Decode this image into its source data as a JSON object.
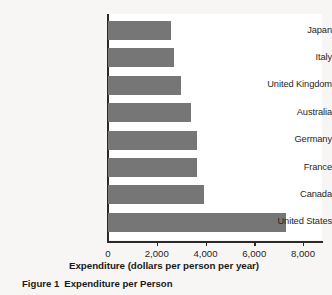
{
  "figure": {
    "caption_label": "Figure 1",
    "caption_title": "Expenditure per Person"
  },
  "colors": {
    "bar_fill": "#767676",
    "axis": "#2a2a2a",
    "plot_background": "#ffffff",
    "page_background": "#f7f6f4",
    "text": "#1f1f1f"
  },
  "chart_data": {
    "type": "bar",
    "orientation": "horizontal",
    "title": "",
    "subtitle": "",
    "xlabel": "Expenditure (dollars per person per year)",
    "ylabel": "",
    "categories": [
      "Japan",
      "Italy",
      "United Kingdom",
      "Australia",
      "Germany",
      "France",
      "Canada",
      "United States"
    ],
    "values": [
      2600,
      2700,
      3000,
      3400,
      3650,
      3650,
      3950,
      7300
    ],
    "xlim": [
      0,
      8800
    ],
    "xticks": [
      0,
      2000,
      4000,
      6000,
      8000
    ],
    "xticklabels": [
      "0",
      "2,000",
      "4,000",
      "6,000",
      "8,000"
    ],
    "grid": false,
    "legend": false,
    "legend_position": "none"
  }
}
